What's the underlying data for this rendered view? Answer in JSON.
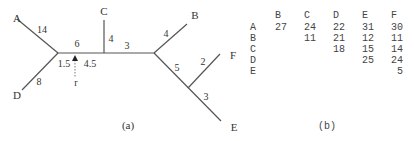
{
  "panel_a": {
    "caption": "(a)",
    "leaves": [
      {
        "label": "A",
        "x": 17,
        "y": 22
      },
      {
        "label": "B",
        "x": 195,
        "y": 19
      },
      {
        "label": "C",
        "x": 104,
        "y": 15
      },
      {
        "label": "D",
        "x": 17,
        "y": 99
      },
      {
        "label": "E",
        "x": 234,
        "y": 131
      },
      {
        "label": "F",
        "x": 233,
        "y": 59
      }
    ],
    "edges": [
      {
        "from": [
          17,
          19
        ],
        "to": [
          58,
          53
        ],
        "name": "edge-a"
      },
      {
        "from": [
          58,
          53
        ],
        "to": [
          22,
          90
        ],
        "name": "edge-d"
      },
      {
        "from": [
          58,
          53
        ],
        "to": [
          154,
          53
        ],
        "name": "edge-spine"
      },
      {
        "from": [
          104,
          53
        ],
        "to": [
          104,
          20
        ],
        "name": "edge-c"
      },
      {
        "from": [
          154,
          53
        ],
        "to": [
          187,
          24
        ],
        "name": "edge-b"
      },
      {
        "from": [
          154,
          53
        ],
        "to": [
          221,
          121
        ],
        "name": "edge-e-path"
      },
      {
        "from": [
          188,
          88
        ],
        "to": [
          220,
          54
        ],
        "name": "edge-f"
      }
    ],
    "weights": [
      {
        "value": "14",
        "x": 42,
        "y": 33
      },
      {
        "value": "8",
        "x": 39,
        "y": 85
      },
      {
        "value": "6",
        "x": 77,
        "y": 47
      },
      {
        "value": "1.5",
        "x": 64,
        "y": 67
      },
      {
        "value": "4.5",
        "x": 90,
        "y": 67
      },
      {
        "value": "4",
        "x": 111,
        "y": 42
      },
      {
        "value": "3",
        "x": 127,
        "y": 49
      },
      {
        "value": "4",
        "x": 166,
        "y": 37
      },
      {
        "value": "5",
        "x": 177,
        "y": 71
      },
      {
        "value": "2",
        "x": 203,
        "y": 65
      },
      {
        "value": "3",
        "x": 206,
        "y": 100
      }
    ],
    "root": {
      "label": "r",
      "x": 76,
      "y": 86,
      "arrow_x": 75,
      "arrow_top": 55,
      "arrow_bottom": 78
    }
  },
  "panel_b": {
    "caption": "(b)",
    "col_headers": [
      "B",
      "C",
      "D",
      "E",
      "F"
    ],
    "row_headers": [
      "A",
      "B",
      "C",
      "D",
      "E"
    ],
    "matrix": [
      [
        "27",
        "24",
        "22",
        "31",
        "30"
      ],
      [
        "",
        "11",
        "21",
        "12",
        "11"
      ],
      [
        "",
        "",
        "18",
        "15",
        "14"
      ],
      [
        "",
        "",
        "",
        "25",
        "24"
      ],
      [
        "",
        "",
        "",
        "",
        "5"
      ]
    ]
  }
}
